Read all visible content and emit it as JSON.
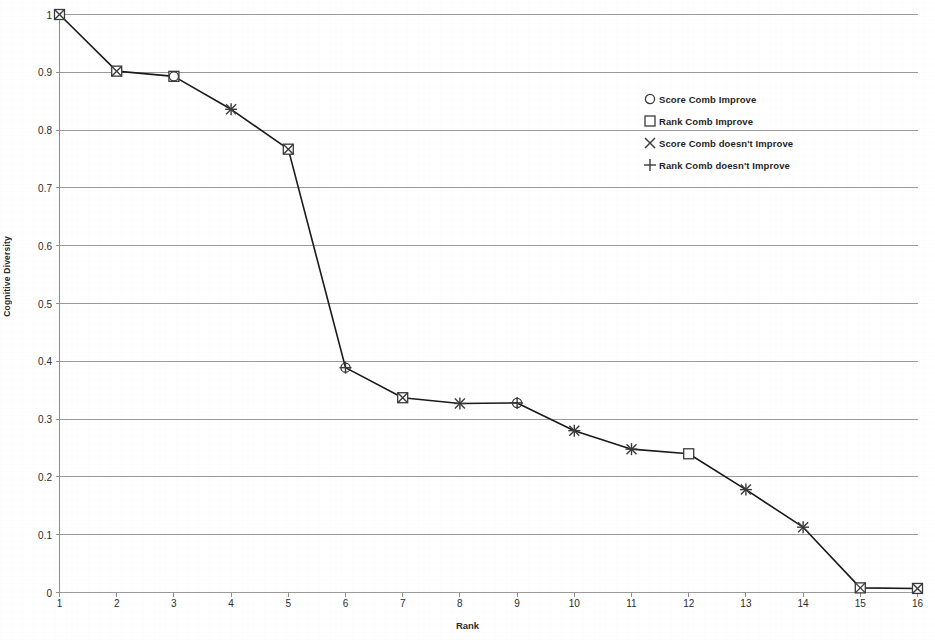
{
  "chart_data": {
    "type": "line",
    "title": "",
    "xlabel": "Rank",
    "ylabel": "Cognitive Diversity",
    "x": [
      1,
      2,
      3,
      4,
      5,
      6,
      7,
      8,
      9,
      10,
      11,
      12,
      13,
      14,
      15,
      16
    ],
    "xlim": [
      1,
      16
    ],
    "ylim": [
      0,
      1
    ],
    "xticks": [
      "1",
      "2",
      "3",
      "4",
      "5",
      "6",
      "7",
      "8",
      "9",
      "10",
      "11",
      "12",
      "13",
      "14",
      "15",
      "16"
    ],
    "yticks": [
      "0",
      "0.1",
      "0.2",
      "0.3",
      "0.4",
      "0.5",
      "0.6",
      "0.7",
      "0.8",
      "0.9",
      "1"
    ],
    "grid": "horizontal",
    "legend_position": "upper-right-inside",
    "line_color": "#1a1a1a",
    "grid_color": "#9a9a9a",
    "values": [
      1.0,
      0.902,
      0.893,
      0.836,
      0.767,
      0.389,
      0.337,
      0.327,
      0.328,
      0.28,
      0.248,
      0.24,
      0.178,
      0.113,
      0.008,
      0.007
    ],
    "points": [
      {
        "rank": 1,
        "value": 1.0,
        "markers": [
          "square",
          "x"
        ]
      },
      {
        "rank": 2,
        "value": 0.902,
        "markers": [
          "square",
          "x"
        ]
      },
      {
        "rank": 3,
        "value": 0.893,
        "markers": [
          "square",
          "circle"
        ]
      },
      {
        "rank": 4,
        "value": 0.836,
        "markers": [
          "x",
          "plus"
        ]
      },
      {
        "rank": 5,
        "value": 0.767,
        "markers": [
          "square",
          "x"
        ]
      },
      {
        "rank": 6,
        "value": 0.389,
        "markers": [
          "circle",
          "plus"
        ]
      },
      {
        "rank": 7,
        "value": 0.337,
        "markers": [
          "square",
          "x"
        ]
      },
      {
        "rank": 8,
        "value": 0.327,
        "markers": [
          "x",
          "plus"
        ]
      },
      {
        "rank": 9,
        "value": 0.328,
        "markers": [
          "circle",
          "plus"
        ]
      },
      {
        "rank": 10,
        "value": 0.28,
        "markers": [
          "x",
          "plus"
        ]
      },
      {
        "rank": 11,
        "value": 0.248,
        "markers": [
          "x",
          "plus"
        ]
      },
      {
        "rank": 12,
        "value": 0.24,
        "markers": [
          "square"
        ]
      },
      {
        "rank": 13,
        "value": 0.178,
        "markers": [
          "x",
          "plus"
        ]
      },
      {
        "rank": 14,
        "value": 0.113,
        "markers": [
          "x",
          "plus"
        ]
      },
      {
        "rank": 15,
        "value": 0.008,
        "markers": [
          "square",
          "x"
        ]
      },
      {
        "rank": 16,
        "value": 0.007,
        "markers": [
          "square",
          "x"
        ]
      }
    ],
    "series": [
      {
        "name": "Score Comb Improve",
        "marker": "circle"
      },
      {
        "name": "Rank Comb Improve",
        "marker": "square"
      },
      {
        "name": "Score Comb doesn't Improve",
        "marker": "x"
      },
      {
        "name": "Rank Comb doesn't Improve",
        "marker": "plus"
      }
    ]
  },
  "legend": {
    "items": [
      {
        "marker": "circle",
        "label": "Score Comb Improve"
      },
      {
        "marker": "square",
        "label": "Rank Comb Improve"
      },
      {
        "marker": "x",
        "label": "Score Comb doesn't Improve"
      },
      {
        "marker": "plus",
        "label": "Rank Comb doesn't Improve"
      }
    ]
  },
  "axes": {
    "x_title": "Rank",
    "y_title": "Cognitive Diversity"
  }
}
